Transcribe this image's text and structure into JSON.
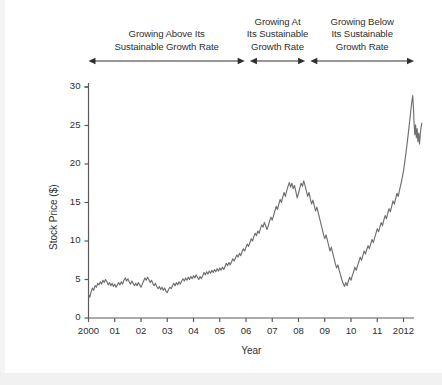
{
  "chart_data": {
    "type": "line",
    "title": "",
    "xlabel": "Year",
    "ylabel": "Stock Price ($)",
    "xlim": [
      2000,
      2012.4
    ],
    "ylim": [
      0,
      30
    ],
    "grid": false,
    "legend": "none",
    "line_color": "#6f6f6f",
    "axis_color": "#5a5a5a",
    "x_tick_labels": [
      "2000",
      "01",
      "02",
      "03",
      "04",
      "05",
      "06",
      "07",
      "08",
      "09",
      "10",
      "11",
      "2012"
    ],
    "x_tick_values": [
      2000,
      2001,
      2002,
      2003,
      2004,
      2005,
      2006,
      2007,
      2008,
      2009,
      2010,
      2011,
      2012
    ],
    "y_tick_labels": [
      "0",
      "5",
      "10",
      "15",
      "20",
      "25",
      "30"
    ],
    "y_tick_values": [
      0,
      5,
      10,
      15,
      20,
      25,
      30
    ],
    "series": [
      {
        "name": "Stock Price",
        "x": [
          2000.0,
          2000.05,
          2000.1,
          2000.15,
          2000.2,
          2000.25,
          2000.3,
          2000.35,
          2000.4,
          2000.45,
          2000.5,
          2000.55,
          2000.6,
          2000.65,
          2000.7,
          2000.75,
          2000.8,
          2000.85,
          2000.9,
          2000.95,
          2001.0,
          2001.05,
          2001.1,
          2001.15,
          2001.2,
          2001.25,
          2001.3,
          2001.35,
          2001.4,
          2001.45,
          2001.5,
          2001.55,
          2001.6,
          2001.65,
          2001.7,
          2001.75,
          2001.8,
          2001.85,
          2001.9,
          2001.95,
          2002.0,
          2002.05,
          2002.1,
          2002.15,
          2002.2,
          2002.25,
          2002.3,
          2002.35,
          2002.4,
          2002.45,
          2002.5,
          2002.55,
          2002.6,
          2002.65,
          2002.7,
          2002.75,
          2002.8,
          2002.85,
          2002.9,
          2002.95,
          2003.0,
          2003.05,
          2003.1,
          2003.15,
          2003.2,
          2003.25,
          2003.3,
          2003.35,
          2003.4,
          2003.45,
          2003.5,
          2003.55,
          2003.6,
          2003.65,
          2003.7,
          2003.75,
          2003.8,
          2003.85,
          2003.9,
          2003.95,
          2004.0,
          2004.05,
          2004.1,
          2004.15,
          2004.2,
          2004.25,
          2004.3,
          2004.35,
          2004.4,
          2004.45,
          2004.5,
          2004.55,
          2004.6,
          2004.65,
          2004.7,
          2004.75,
          2004.8,
          2004.85,
          2004.9,
          2004.95,
          2005.0,
          2005.05,
          2005.1,
          2005.15,
          2005.2,
          2005.25,
          2005.3,
          2005.35,
          2005.4,
          2005.45,
          2005.5,
          2005.55,
          2005.6,
          2005.65,
          2005.7,
          2005.75,
          2005.8,
          2005.85,
          2005.9,
          2005.95,
          2006.0,
          2006.05,
          2006.1,
          2006.15,
          2006.2,
          2006.25,
          2006.3,
          2006.35,
          2006.4,
          2006.45,
          2006.5,
          2006.55,
          2006.6,
          2006.65,
          2006.7,
          2006.75,
          2006.8,
          2006.85,
          2006.9,
          2006.95,
          2007.0,
          2007.05,
          2007.1,
          2007.15,
          2007.2,
          2007.25,
          2007.3,
          2007.35,
          2007.4,
          2007.45,
          2007.5,
          2007.55,
          2007.6,
          2007.65,
          2007.7,
          2007.75,
          2007.8,
          2007.85,
          2007.9,
          2007.95,
          2008.0,
          2008.05,
          2008.1,
          2008.15,
          2008.2,
          2008.25,
          2008.3,
          2008.35,
          2008.4,
          2008.45,
          2008.5,
          2008.55,
          2008.6,
          2008.65,
          2008.7,
          2008.75,
          2008.8,
          2008.85,
          2008.9,
          2008.95,
          2009.0,
          2009.05,
          2009.1,
          2009.15,
          2009.2,
          2009.25,
          2009.3,
          2009.35,
          2009.4,
          2009.45,
          2009.5,
          2009.55,
          2009.6,
          2009.65,
          2009.7,
          2009.75,
          2009.8,
          2009.85,
          2009.9,
          2009.95,
          2010.0,
          2010.05,
          2010.1,
          2010.15,
          2010.2,
          2010.25,
          2010.3,
          2010.35,
          2010.4,
          2010.45,
          2010.5,
          2010.55,
          2010.6,
          2010.65,
          2010.7,
          2010.75,
          2010.8,
          2010.85,
          2010.9,
          2010.95,
          2011.0,
          2011.05,
          2011.1,
          2011.15,
          2011.2,
          2011.25,
          2011.3,
          2011.35,
          2011.4,
          2011.45,
          2011.5,
          2011.55,
          2011.6,
          2011.65,
          2011.7,
          2011.75,
          2011.8,
          2011.85,
          2011.9,
          2011.95,
          2012.0,
          2012.05,
          2012.1,
          2012.15,
          2012.2,
          2012.25,
          2012.3,
          2012.35
        ],
        "y": [
          3.1,
          2.7,
          3.4,
          3.9,
          3.6,
          4.2,
          4.0,
          4.5,
          4.3,
          4.7,
          4.4,
          4.9,
          4.6,
          5.0,
          4.7,
          4.3,
          4.6,
          4.2,
          4.5,
          4.1,
          4.4,
          4.0,
          4.3,
          4.6,
          4.3,
          4.7,
          4.4,
          4.9,
          5.2,
          4.8,
          5.1,
          4.7,
          4.4,
          4.8,
          4.5,
          4.2,
          4.5,
          4.2,
          4.6,
          4.3,
          4.0,
          4.4,
          4.8,
          5.2,
          4.9,
          5.3,
          5.0,
          4.6,
          4.9,
          4.5,
          4.2,
          4.5,
          4.1,
          3.8,
          4.1,
          3.7,
          4.0,
          3.6,
          3.9,
          3.5,
          3.3,
          3.7,
          4.0,
          3.8,
          4.2,
          4.5,
          4.2,
          4.6,
          4.3,
          4.7,
          4.4,
          4.8,
          5.1,
          4.8,
          5.2,
          4.9,
          5.3,
          5.0,
          5.4,
          5.1,
          5.5,
          5.2,
          5.6,
          5.3,
          5.0,
          5.4,
          5.1,
          5.5,
          5.9,
          5.6,
          6.0,
          5.7,
          6.1,
          5.8,
          6.2,
          5.9,
          6.3,
          6.0,
          6.4,
          6.1,
          6.5,
          6.2,
          6.6,
          6.3,
          6.7,
          7.1,
          6.8,
          7.2,
          6.9,
          7.3,
          7.7,
          7.4,
          7.8,
          8.2,
          7.9,
          8.4,
          8.1,
          8.6,
          9.0,
          8.7,
          9.2,
          9.6,
          9.3,
          9.8,
          10.3,
          10.0,
          10.6,
          11.0,
          10.7,
          11.3,
          11.0,
          11.6,
          12.1,
          11.8,
          12.4,
          12.0,
          11.5,
          12.0,
          12.6,
          13.1,
          12.7,
          13.3,
          13.9,
          14.5,
          14.1,
          14.8,
          15.4,
          15.0,
          15.7,
          16.3,
          15.8,
          16.5,
          17.1,
          17.6,
          17.0,
          17.5,
          16.8,
          17.2,
          16.4,
          15.6,
          16.2,
          16.9,
          17.5,
          17.1,
          17.8,
          17.2,
          16.5,
          15.8,
          16.3,
          15.5,
          14.8,
          15.3,
          14.6,
          13.9,
          14.4,
          13.7,
          13.0,
          12.3,
          11.6,
          10.9,
          10.3,
          10.8,
          10.1,
          9.4,
          8.7,
          9.2,
          8.5,
          7.8,
          7.1,
          6.5,
          6.9,
          6.2,
          5.6,
          5.0,
          4.5,
          4.1,
          4.6,
          4.2,
          4.8,
          5.3,
          4.9,
          5.5,
          6.0,
          6.6,
          6.2,
          6.8,
          7.3,
          7.9,
          7.5,
          8.1,
          8.7,
          8.3,
          8.9,
          9.4,
          9.0,
          9.6,
          10.2,
          9.8,
          10.4,
          11.0,
          11.6,
          11.2,
          11.8,
          12.4,
          12.0,
          12.7,
          13.3,
          12.9,
          13.6,
          14.2,
          13.8,
          14.5,
          15.2,
          14.8,
          15.5,
          16.2,
          15.8,
          16.6,
          17.4,
          18.2,
          19.1,
          20.3,
          21.6,
          23.0,
          24.5,
          26.0,
          27.6,
          28.9
        ],
        "annotations": [
          {
            "label": "2000 start",
            "value": 3.1
          },
          {
            "label": "2002 trough",
            "value": 3.3
          },
          {
            "label": "2007 peak",
            "value": 17.8
          },
          {
            "label": "2009 trough",
            "value": 4.1
          },
          {
            "label": "2012 peak",
            "value": 28.9
          },
          {
            "label": "2012 end",
            "value": 25.3
          }
        ]
      }
    ],
    "tail": {
      "x": [
        2012.35,
        2012.38,
        2012.4,
        2012.43,
        2012.46,
        2012.49,
        2012.52,
        2012.55,
        2012.58,
        2012.61,
        2012.64,
        2012.67,
        2012.7
      ],
      "y": [
        28.9,
        27.2,
        25.5,
        23.8,
        25.1,
        23.4,
        24.6,
        22.9,
        24.0,
        22.6,
        23.9,
        24.8,
        25.3
      ]
    }
  },
  "phases": [
    {
      "id": "above",
      "lines": [
        "Growing Above Its",
        "Sustainable Growth Rate"
      ],
      "x_start": 2000.0,
      "x_end": 2005.95
    },
    {
      "id": "at",
      "lines": [
        "Growing At",
        "Its Sustainable",
        "Growth Rate"
      ],
      "x_start": 2006.15,
      "x_end": 2008.25
    },
    {
      "id": "below",
      "lines": [
        "Growing Below",
        "Its Sustainable",
        "Growth Rate"
      ],
      "x_start": 2008.45,
      "x_end": 2012.4
    }
  ]
}
